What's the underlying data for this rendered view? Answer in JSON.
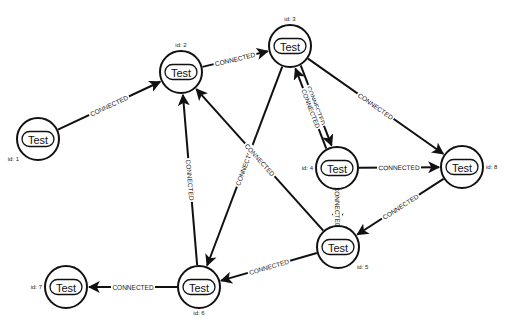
{
  "graph": {
    "nodes": [
      {
        "id": "1",
        "id_label": "id: 1",
        "label": "Test"
      },
      {
        "id": "2",
        "id_label": "id: 2",
        "label": "Test"
      },
      {
        "id": "3",
        "id_label": "id: 3",
        "label": "Test"
      },
      {
        "id": "4",
        "id_label": "id: 4",
        "label": "Test"
      },
      {
        "id": "5",
        "id_label": "id: 5",
        "label": "Test"
      },
      {
        "id": "6",
        "id_label": "id: 6",
        "label": "Test"
      },
      {
        "id": "7",
        "id_label": "id: 7",
        "label": "Test"
      },
      {
        "id": "8",
        "id_label": "id: 8",
        "label": "Test"
      }
    ],
    "edges": [
      {
        "from": "1",
        "to": "2",
        "label": "CONNECTED"
      },
      {
        "from": "2",
        "to": "3",
        "label": "CONNECTED"
      },
      {
        "from": "3",
        "to": "4",
        "label": "CONNECTED"
      },
      {
        "from": "4",
        "to": "3",
        "label": "CONNECTED"
      },
      {
        "from": "3",
        "to": "8",
        "label": "CONNECTED"
      },
      {
        "from": "3",
        "to": "6",
        "label": "CONNECTED"
      },
      {
        "from": "4",
        "to": "8",
        "label": "CONNECTED"
      },
      {
        "from": "4",
        "to": "5",
        "label": "CONNECTED"
      },
      {
        "from": "8",
        "to": "5",
        "label": "CONNECTED"
      },
      {
        "from": "5",
        "to": "2",
        "label": "CONNECTED"
      },
      {
        "from": "5",
        "to": "6",
        "label": "CONNECTED"
      },
      {
        "from": "6",
        "to": "2",
        "label": "CONNECTED"
      },
      {
        "from": "6",
        "to": "7",
        "label": "CONNECTED"
      }
    ]
  }
}
